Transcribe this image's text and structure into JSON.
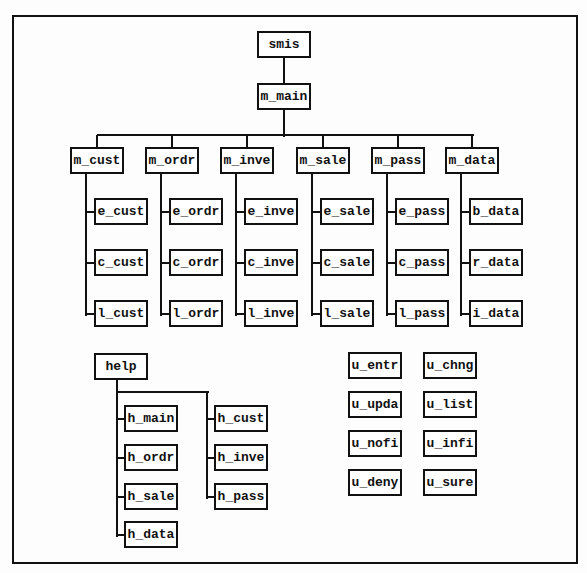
{
  "diagram": {
    "type": "hierarchy_chart",
    "root": {
      "label": "smis",
      "x": 257,
      "y": 31,
      "w": 54
    },
    "main": {
      "label": "m_main",
      "x": 257,
      "y": 83,
      "w": 54
    },
    "menus": [
      {
        "label": "m_cust",
        "x": 70,
        "children": [
          "e_cust",
          "c_cust",
          "l_cust"
        ]
      },
      {
        "label": "m_ordr",
        "x": 145,
        "children": [
          "e_ordr",
          "c_ordr",
          "l_ordr"
        ]
      },
      {
        "label": "m_inve",
        "x": 220,
        "children": [
          "e_inve",
          "c_inve",
          "l_inve"
        ]
      },
      {
        "label": "m_sale",
        "x": 296,
        "children": [
          "e_sale",
          "c_sale",
          "l_sale"
        ]
      },
      {
        "label": "m_pass",
        "x": 371,
        "children": [
          "e_pass",
          "c_pass",
          "l_pass"
        ]
      },
      {
        "label": "m_data",
        "x": 445,
        "children": [
          "b_data",
          "r_data",
          "i_data"
        ]
      }
    ],
    "help": {
      "label": "help",
      "left_children": [
        "h_main",
        "h_ordr",
        "h_sale",
        "h_data"
      ],
      "right_children": [
        "h_cust",
        "h_inve",
        "h_pass"
      ]
    },
    "utilities": {
      "left_column": [
        "u_entr",
        "u_upda",
        "u_nofi",
        "u_deny"
      ],
      "right_column": [
        "u_chng",
        "u_list",
        "u_infi",
        "u_sure"
      ]
    }
  }
}
